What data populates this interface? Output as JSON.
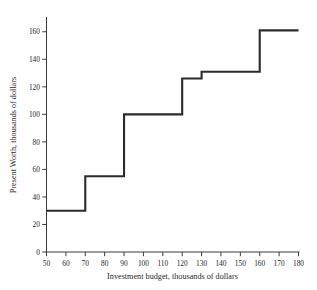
{
  "chart_data": {
    "type": "line",
    "subtype": "step-post",
    "title": "",
    "xlabel": "Investment budget, thousands of dollars",
    "ylabel": "Present Worth, thousands of dollars",
    "xlim": [
      50,
      180
    ],
    "ylim": [
      0,
      170
    ],
    "xticks": [
      50,
      60,
      70,
      80,
      90,
      100,
      110,
      120,
      130,
      140,
      150,
      160,
      170,
      180
    ],
    "yticks": [
      0,
      20,
      40,
      60,
      80,
      100,
      120,
      140,
      160
    ],
    "xtick_labels": [
      "50",
      "60",
      "70",
      "80",
      "90",
      "100",
      "110",
      "120",
      "130",
      "140",
      "150",
      "160",
      "170",
      "180"
    ],
    "ytick_labels": [
      "0",
      "20",
      "40",
      "60",
      "80",
      "100",
      "120",
      "140",
      "160"
    ],
    "grid": false,
    "legend": false,
    "legend_position": "none",
    "series": [
      {
        "name": "Present Worth",
        "color": "#2b2b2b",
        "steps": [
          {
            "x_start": 50,
            "x_end": 70,
            "y": 30
          },
          {
            "x_start": 70,
            "x_end": 90,
            "y": 55
          },
          {
            "x_start": 90,
            "x_end": 120,
            "y": 100
          },
          {
            "x_start": 120,
            "x_end": 130,
            "y": 126
          },
          {
            "x_start": 130,
            "x_end": 160,
            "y": 131
          },
          {
            "x_start": 160,
            "x_end": 180,
            "y": 161
          }
        ],
        "x": [
          50,
          70,
          70,
          90,
          90,
          120,
          120,
          130,
          130,
          160,
          160,
          180
        ],
        "y": [
          30,
          30,
          55,
          55,
          100,
          100,
          126,
          126,
          131,
          131,
          161,
          161
        ]
      }
    ]
  }
}
